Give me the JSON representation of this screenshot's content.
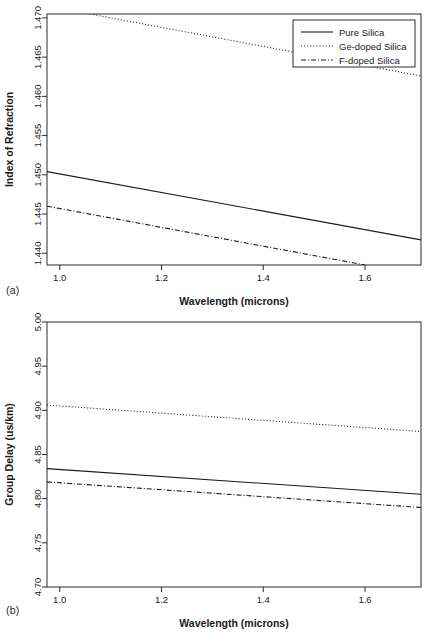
{
  "figure": {
    "panels": [
      {
        "tag": "(a)",
        "xlabel": "Wavelength (microns)",
        "ylabel": "Index of Refraction"
      },
      {
        "tag": "(b)",
        "xlabel": "Wavelength (microns)",
        "ylabel": "Group Delay (us/km)"
      }
    ],
    "legend": {
      "entries": [
        {
          "label": "Pure Silica",
          "style": "solid"
        },
        {
          "label": "Ge-doped Silica",
          "style": "dotted"
        },
        {
          "label": "F-doped Silica",
          "style": "dashdot"
        }
      ]
    },
    "colors": {
      "ink": "#1a1a1a",
      "frame": "#2b2b2b",
      "background": "#ffffff"
    }
  },
  "chart_data": [
    {
      "type": "line",
      "title": "",
      "panel": "(a)",
      "xlabel": "Wavelength (microns)",
      "ylabel": "Index of Refraction",
      "xlim": [
        0.975,
        1.71
      ],
      "ylim": [
        1.4385,
        1.4705
      ],
      "xticks": [
        1.0,
        1.2,
        1.4,
        1.6
      ],
      "xticklabels": [
        "1.0",
        "1.2",
        "1.4",
        "1.6"
      ],
      "yticks": [
        1.44,
        1.445,
        1.45,
        1.455,
        1.46,
        1.465,
        1.47
      ],
      "yticklabels": [
        "1.440",
        "1.445",
        "1.450",
        "1.455",
        "1.460",
        "1.465",
        "1.470"
      ],
      "grid": false,
      "legend_position": "top-right",
      "series": [
        {
          "name": "Pure Silica",
          "style": "solid",
          "x": [
            0.975,
            1.71
          ],
          "values": [
            1.4504,
            1.4417
          ]
        },
        {
          "name": "Ge-doped Silica",
          "style": "dotted",
          "x": [
            1.06,
            1.71
          ],
          "values": [
            1.4705,
            1.4626
          ]
        },
        {
          "name": "F-doped Silica",
          "style": "dashdot",
          "x": [
            0.975,
            1.6
          ],
          "values": [
            1.446,
            1.4385
          ]
        }
      ]
    },
    {
      "type": "line",
      "title": "",
      "panel": "(b)",
      "xlabel": "Wavelength (microns)",
      "ylabel": "Group Delay (us/km)",
      "xlim": [
        0.975,
        1.71
      ],
      "ylim": [
        4.7,
        5.0
      ],
      "xticks": [
        1.0,
        1.2,
        1.4,
        1.6
      ],
      "xticklabels": [
        "1.0",
        "1.2",
        "1.4",
        "1.6"
      ],
      "yticks": [
        4.7,
        4.75,
        4.8,
        4.85,
        4.9,
        4.95,
        5.0
      ],
      "yticklabels": [
        "4.70",
        "4.75",
        "4.80",
        "4.85",
        "4.90",
        "4.95",
        "5.00"
      ],
      "grid": false,
      "legend_position": "none",
      "series": [
        {
          "name": "Pure Silica",
          "style": "solid",
          "x": [
            0.975,
            1.71
          ],
          "values": [
            4.834,
            4.805
          ]
        },
        {
          "name": "Ge-doped Silica",
          "style": "dotted",
          "x": [
            0.975,
            1.71
          ],
          "values": [
            4.906,
            4.876
          ]
        },
        {
          "name": "F-doped Silica",
          "style": "dashdot",
          "x": [
            0.975,
            1.71
          ],
          "values": [
            4.819,
            4.79
          ]
        }
      ]
    }
  ]
}
